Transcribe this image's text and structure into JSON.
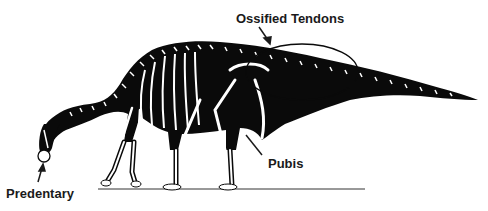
{
  "figure": {
    "labels": {
      "ossified_tendons": "Ossified Tendons",
      "pubis": "Pubis",
      "predentary": "Predentary"
    }
  },
  "colors": {
    "silhouette": "#0a0a0a",
    "bone": "#ffffff",
    "text": "#1a1a1a",
    "background": "#ffffff"
  }
}
